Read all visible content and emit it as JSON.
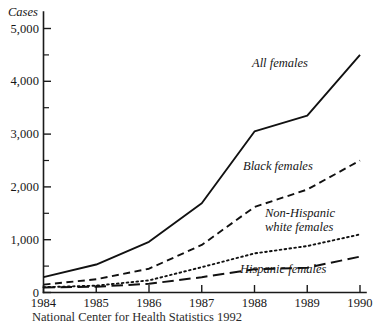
{
  "chart_data": {
    "type": "line",
    "title": "",
    "ylabel": "Cases",
    "xlabel": "",
    "categories": [
      "1984",
      "1985",
      "1986",
      "1987",
      "1988",
      "1989",
      "1990"
    ],
    "x": [
      1984,
      1985,
      1986,
      1987,
      1988,
      1989,
      1990
    ],
    "ylim": [
      0,
      5200
    ],
    "xlim": [
      1984,
      1990
    ],
    "grid": false,
    "legend": "inline-annotations",
    "ytick_labels": [
      "0",
      "1,000",
      "2,000",
      "3,000",
      "4,000",
      "5,000"
    ],
    "ytick_values": [
      0,
      1000,
      2000,
      3000,
      4000,
      5000
    ],
    "yminor_values": [
      500,
      1500,
      2500,
      3500,
      4500
    ],
    "series": [
      {
        "name": "All females",
        "style": "solid",
        "values": [
          290,
          530,
          960,
          1690,
          3050,
          3350,
          4500
        ]
      },
      {
        "name": "Black females",
        "style": "dashed",
        "values": [
          150,
          250,
          450,
          900,
          1620,
          1950,
          2500
        ]
      },
      {
        "name": "Non-Hispanic white females",
        "style": "dotted",
        "values": [
          100,
          130,
          230,
          480,
          740,
          880,
          1100
        ]
      },
      {
        "name": "Hispanic females",
        "style": "long-dash",
        "values": [
          95,
          110,
          165,
          290,
          440,
          470,
          680
        ]
      }
    ],
    "annotations": [
      {
        "text": "All females",
        "series": "All females"
      },
      {
        "text": "Black females",
        "series": "Black females"
      },
      {
        "text": "Non-Hispanic",
        "series": "Non-Hispanic white females"
      },
      {
        "text": "white females",
        "series": "Non-Hispanic white females"
      },
      {
        "text": "Hispanic females",
        "series": "Hispanic females"
      }
    ],
    "caption": "National Center for Health Statistics 1992"
  }
}
